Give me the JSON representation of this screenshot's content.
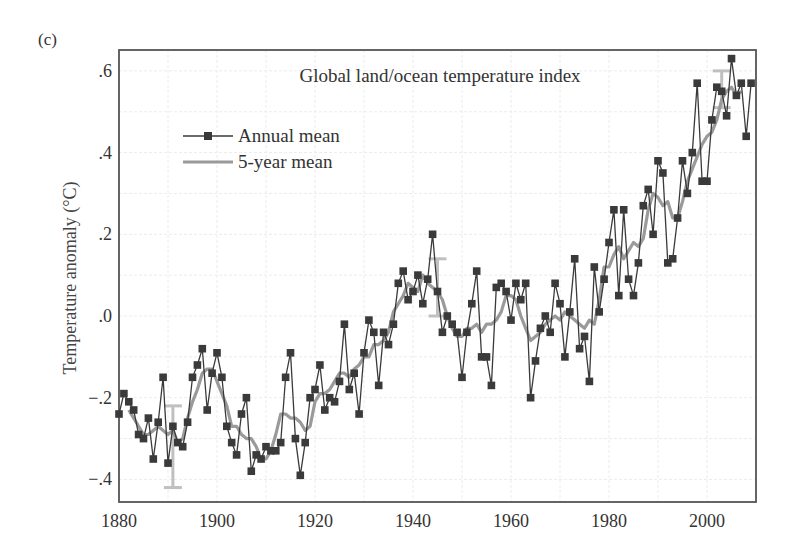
{
  "panel_label": "(c)",
  "chart_data": {
    "type": "line",
    "title": "Global land/ocean temperature index",
    "xlabel": "",
    "ylabel": "Temperature anomaly (°C)",
    "xlim": [
      1880,
      2010
    ],
    "ylim": [
      -0.45,
      0.66
    ],
    "x_ticks": [
      1880,
      1900,
      1920,
      1940,
      1960,
      1980,
      2000
    ],
    "x_tick_labels": [
      "1880",
      "1900",
      "1920",
      "1940",
      "1960",
      "1980",
      "2000"
    ],
    "y_ticks": [
      -0.4,
      -0.2,
      0.0,
      0.2,
      0.4,
      0.6
    ],
    "y_tick_labels": [
      "−.4",
      "−.2",
      ".0",
      ".2",
      ".4",
      ".6"
    ],
    "grid": true,
    "legend_position": "upper-left",
    "legend": [
      "Annual mean",
      "5-year mean"
    ],
    "colors": {
      "annual": "#3a3a3a",
      "five_year": "#9a9a9a",
      "error_bar": "#c0c0c0",
      "frame": "#555555",
      "grid": "#e6e6e6"
    },
    "x": [
      1880,
      1881,
      1882,
      1883,
      1884,
      1885,
      1886,
      1887,
      1888,
      1889,
      1890,
      1891,
      1892,
      1893,
      1894,
      1895,
      1896,
      1897,
      1898,
      1899,
      1900,
      1901,
      1902,
      1903,
      1904,
      1905,
      1906,
      1907,
      1908,
      1909,
      1910,
      1911,
      1912,
      1913,
      1914,
      1915,
      1916,
      1917,
      1918,
      1919,
      1920,
      1921,
      1922,
      1923,
      1924,
      1925,
      1926,
      1927,
      1928,
      1929,
      1930,
      1931,
      1932,
      1933,
      1934,
      1935,
      1936,
      1937,
      1938,
      1939,
      1940,
      1941,
      1942,
      1943,
      1944,
      1945,
      1946,
      1947,
      1948,
      1949,
      1950,
      1951,
      1952,
      1953,
      1954,
      1955,
      1956,
      1957,
      1958,
      1959,
      1960,
      1961,
      1962,
      1963,
      1964,
      1965,
      1966,
      1967,
      1968,
      1969,
      1970,
      1971,
      1972,
      1973,
      1974,
      1975,
      1976,
      1977,
      1978,
      1979,
      1980,
      1981,
      1982,
      1983,
      1984,
      1985,
      1986,
      1987,
      1988,
      1989,
      1990,
      1991,
      1992,
      1993,
      1994,
      1995,
      1996,
      1997,
      1998,
      1999,
      2000,
      2001,
      2002,
      2003,
      2004,
      2005,
      2006,
      2007,
      2008,
      2009
    ],
    "series": [
      {
        "name": "Annual mean",
        "values": [
          -0.24,
          -0.19,
          -0.21,
          -0.23,
          -0.29,
          -0.3,
          -0.25,
          -0.35,
          -0.26,
          -0.15,
          -0.36,
          -0.27,
          -0.31,
          -0.32,
          -0.26,
          -0.15,
          -0.12,
          -0.08,
          -0.23,
          -0.14,
          -0.09,
          -0.15,
          -0.27,
          -0.31,
          -0.34,
          -0.24,
          -0.2,
          -0.38,
          -0.34,
          -0.35,
          -0.32,
          -0.33,
          -0.33,
          -0.31,
          -0.15,
          -0.09,
          -0.3,
          -0.39,
          -0.31,
          -0.2,
          -0.18,
          -0.12,
          -0.23,
          -0.2,
          -0.21,
          -0.16,
          -0.02,
          -0.18,
          -0.14,
          -0.24,
          -0.09,
          -0.01,
          -0.04,
          -0.17,
          -0.04,
          -0.07,
          -0.02,
          0.08,
          0.11,
          0.04,
          0.06,
          0.1,
          0.03,
          0.09,
          0.2,
          0.06,
          -0.04,
          0.0,
          -0.02,
          -0.04,
          -0.15,
          -0.04,
          0.03,
          0.11,
          -0.1,
          -0.1,
          -0.17,
          0.07,
          0.08,
          0.06,
          -0.01,
          0.08,
          0.04,
          0.08,
          -0.2,
          -0.11,
          -0.03,
          0.0,
          -0.04,
          0.08,
          0.03,
          -0.1,
          0.01,
          0.14,
          -0.08,
          -0.05,
          -0.16,
          0.12,
          0.01,
          0.09,
          0.18,
          0.26,
          0.05,
          0.26,
          0.09,
          0.05,
          0.13,
          0.27,
          0.31,
          0.2,
          0.38,
          0.35,
          0.13,
          0.14,
          0.24,
          0.38,
          0.3,
          0.4,
          0.57,
          0.33,
          0.33,
          0.48,
          0.56,
          0.55,
          0.49,
          0.63,
          0.54,
          0.57,
          0.44,
          0.57
        ]
      },
      {
        "name": "5-year mean",
        "values": [
          null,
          null,
          -0.23,
          -0.25,
          -0.27,
          -0.29,
          -0.29,
          -0.28,
          -0.27,
          -0.28,
          -0.29,
          -0.28,
          -0.31,
          -0.3,
          -0.25,
          -0.21,
          -0.18,
          -0.14,
          -0.13,
          -0.13,
          -0.16,
          -0.19,
          -0.22,
          -0.27,
          -0.27,
          -0.29,
          -0.3,
          -0.3,
          -0.32,
          -0.35,
          -0.35,
          -0.33,
          -0.29,
          -0.24,
          -0.24,
          -0.25,
          -0.25,
          -0.26,
          -0.28,
          -0.27,
          -0.21,
          -0.19,
          -0.19,
          -0.18,
          -0.16,
          -0.14,
          -0.14,
          -0.15,
          -0.13,
          -0.12,
          -0.1,
          -0.1,
          -0.07,
          -0.07,
          -0.06,
          -0.04,
          0.01,
          0.03,
          0.05,
          0.08,
          0.07,
          0.06,
          0.1,
          0.08,
          0.07,
          0.06,
          0.04,
          0.0,
          -0.03,
          -0.05,
          -0.05,
          -0.03,
          -0.03,
          -0.02,
          -0.04,
          -0.02,
          -0.02,
          -0.01,
          0.01,
          0.05,
          0.05,
          0.04,
          0.0,
          -0.03,
          -0.06,
          -0.05,
          -0.04,
          -0.02,
          -0.01,
          0.0,
          -0.01,
          0.01,
          0.0,
          -0.01,
          -0.02,
          -0.03,
          -0.01,
          -0.02,
          0.04,
          0.12,
          0.12,
          0.15,
          0.17,
          0.14,
          0.16,
          0.18,
          0.17,
          0.19,
          0.26,
          0.3,
          0.29,
          0.27,
          0.28,
          0.24,
          0.24,
          0.28,
          0.33,
          0.36,
          0.39,
          0.42,
          0.44,
          0.45,
          0.48,
          0.53,
          0.55,
          0.56,
          0.54,
          0.55,
          null,
          null
        ]
      }
    ],
    "error_bars": [
      {
        "x": 1891,
        "low": -0.42,
        "high": -0.22
      },
      {
        "x": 1945,
        "low": 0.0,
        "high": 0.14
      },
      {
        "x": 2003,
        "low": 0.51,
        "high": 0.6
      }
    ]
  }
}
